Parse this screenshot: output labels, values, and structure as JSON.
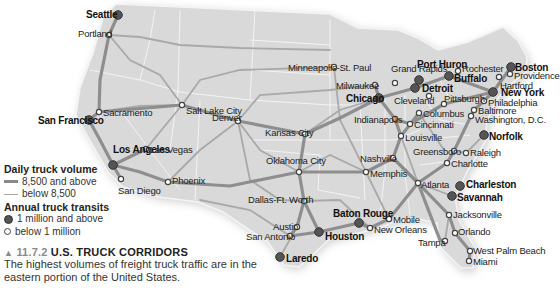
{
  "map": {
    "title": "U.S. Truck Corridors",
    "land_color": "#d8d8d8",
    "border_color": "#ffffff",
    "route_major_color": "#8a8a8a",
    "route_minor_color": "#a8a8a8",
    "cities": [
      {
        "name": "Seattle",
        "size": "major",
        "x": 118,
        "y": 15,
        "lx": 86,
        "ly": 10
      },
      {
        "name": "Portland",
        "size": "minor",
        "x": 109,
        "y": 35,
        "lx": 78,
        "ly": 29
      },
      {
        "name": "San Francisco",
        "size": "major",
        "x": 89,
        "y": 120,
        "lx": 38,
        "ly": 116
      },
      {
        "name": "Sacramento",
        "size": "minor",
        "x": 99,
        "y": 112,
        "lx": 103,
        "ly": 108
      },
      {
        "name": "Los Angeles",
        "size": "major",
        "x": 113,
        "y": 165,
        "lx": 113,
        "ly": 145
      },
      {
        "name": "Las Vegas",
        "size": "minor",
        "x": 146,
        "y": 149,
        "lx": 150,
        "ly": 145
      },
      {
        "name": "San Diego",
        "size": "minor",
        "x": 121,
        "y": 179,
        "lx": 118,
        "ly": 186
      },
      {
        "name": "Phoenix",
        "size": "minor",
        "x": 168,
        "y": 182,
        "lx": 172,
        "ly": 176
      },
      {
        "name": "Salt Lake City",
        "size": "minor",
        "x": 182,
        "y": 105,
        "lx": 186,
        "ly": 106
      },
      {
        "name": "Denver",
        "size": "minor",
        "x": 238,
        "y": 121,
        "lx": 212,
        "ly": 113
      },
      {
        "name": "Minneapolis-St. Paul",
        "size": "minor",
        "x": 334,
        "y": 67,
        "lx": 288,
        "ly": 63
      },
      {
        "name": "Milwaukee",
        "size": "minor",
        "x": 375,
        "y": 85,
        "lx": 336,
        "ly": 81
      },
      {
        "name": "Chicago",
        "size": "major",
        "x": 379,
        "y": 98,
        "lx": 346,
        "ly": 94
      },
      {
        "name": "Grand Rapids",
        "size": "minor",
        "x": 395,
        "y": 83,
        "lx": 391,
        "ly": 64
      },
      {
        "name": "Port Huron",
        "size": "major",
        "x": 419,
        "y": 80,
        "lx": 417,
        "ly": 60
      },
      {
        "name": "Detroit",
        "size": "major",
        "x": 415,
        "y": 88,
        "lx": 422,
        "ly": 84
      },
      {
        "name": "Cleveland",
        "size": "minor",
        "x": 429,
        "y": 96,
        "lx": 394,
        "ly": 96
      },
      {
        "name": "Buffalo",
        "size": "major",
        "x": 449,
        "y": 76,
        "lx": 454,
        "ly": 74
      },
      {
        "name": "Rochester",
        "size": "minor",
        "x": 458,
        "y": 71,
        "lx": 462,
        "ly": 64
      },
      {
        "name": "Pittsburgh",
        "size": "minor",
        "x": 444,
        "y": 104,
        "lx": 444,
        "ly": 94
      },
      {
        "name": "Columbus",
        "size": "minor",
        "x": 419,
        "y": 113,
        "lx": 423,
        "ly": 109
      },
      {
        "name": "Cincinnati",
        "size": "minor",
        "x": 410,
        "y": 124,
        "lx": 414,
        "ly": 120
      },
      {
        "name": "Indianapolis",
        "size": "minor",
        "x": 395,
        "y": 119,
        "lx": 354,
        "ly": 115
      },
      {
        "name": "Louisville",
        "size": "minor",
        "x": 401,
        "y": 136,
        "lx": 405,
        "ly": 133
      },
      {
        "name": "Boston",
        "size": "major",
        "x": 511,
        "y": 67,
        "lx": 515,
        "ly": 63
      },
      {
        "name": "Providence",
        "size": "minor",
        "x": 510,
        "y": 74,
        "lx": 514,
        "ly": 71
      },
      {
        "name": "Hartford",
        "size": "minor",
        "x": 499,
        "y": 77,
        "lx": 500,
        "ly": 81
      },
      {
        "name": "New York",
        "size": "major",
        "x": 493,
        "y": 92,
        "lx": 501,
        "ly": 88
      },
      {
        "name": "Philadelphia",
        "size": "minor",
        "x": 484,
        "y": 101,
        "lx": 488,
        "ly": 98
      },
      {
        "name": "Baltimore",
        "size": "minor",
        "x": 474,
        "y": 110,
        "lx": 478,
        "ly": 106
      },
      {
        "name": "Washington, D.C.",
        "size": "minor",
        "x": 471,
        "y": 116,
        "lx": 475,
        "ly": 115
      },
      {
        "name": "Norfolk",
        "size": "major",
        "x": 484,
        "y": 135,
        "lx": 489,
        "ly": 132
      },
      {
        "name": "Greensboro",
        "size": "minor",
        "x": 454,
        "y": 151,
        "lx": 413,
        "ly": 147
      },
      {
        "name": "Raleigh",
        "size": "minor",
        "x": 466,
        "y": 153,
        "lx": 470,
        "ly": 148
      },
      {
        "name": "Charlotte",
        "size": "minor",
        "x": 447,
        "y": 163,
        "lx": 451,
        "ly": 159
      },
      {
        "name": "Nashville",
        "size": "minor",
        "x": 393,
        "y": 158,
        "lx": 360,
        "ly": 154
      },
      {
        "name": "Memphis",
        "size": "minor",
        "x": 366,
        "y": 172,
        "lx": 370,
        "ly": 169
      },
      {
        "name": "Atlanta",
        "size": "minor",
        "x": 418,
        "y": 183,
        "lx": 421,
        "ly": 180
      },
      {
        "name": "Charleston",
        "size": "major",
        "x": 460,
        "y": 186,
        "lx": 466,
        "ly": 180
      },
      {
        "name": "Savannah",
        "size": "major",
        "x": 452,
        "y": 196,
        "lx": 457,
        "ly": 193
      },
      {
        "name": "Jacksonville",
        "size": "minor",
        "x": 449,
        "y": 215,
        "lx": 453,
        "ly": 210
      },
      {
        "name": "Orlando",
        "size": "minor",
        "x": 455,
        "y": 233,
        "lx": 458,
        "ly": 227
      },
      {
        "name": "Tampa",
        "size": "minor",
        "x": 445,
        "y": 241,
        "lx": 418,
        "ly": 238
      },
      {
        "name": "West Palm Beach",
        "size": "minor",
        "x": 470,
        "y": 251,
        "lx": 473,
        "ly": 246
      },
      {
        "name": "Miami",
        "size": "minor",
        "x": 469,
        "y": 261,
        "lx": 473,
        "ly": 257
      },
      {
        "name": "Mobile",
        "size": "minor",
        "x": 389,
        "y": 219,
        "lx": 393,
        "ly": 215
      },
      {
        "name": "New Orleans",
        "size": "minor",
        "x": 370,
        "y": 228,
        "lx": 374,
        "ly": 225
      },
      {
        "name": "Baton Rouge",
        "size": "major",
        "x": 359,
        "y": 223,
        "lx": 333,
        "ly": 209
      },
      {
        "name": "Houston",
        "size": "major",
        "x": 319,
        "y": 232,
        "lx": 325,
        "ly": 232
      },
      {
        "name": "Austin",
        "size": "minor",
        "x": 297,
        "y": 227,
        "lx": 273,
        "ly": 222
      },
      {
        "name": "San Antonio",
        "size": "minor",
        "x": 290,
        "y": 236,
        "lx": 246,
        "ly": 232
      },
      {
        "name": "Laredo",
        "size": "major",
        "x": 280,
        "y": 257,
        "lx": 286,
        "ly": 254
      },
      {
        "name": "Dallas-Ft. Worth",
        "size": "minor",
        "x": 304,
        "y": 201,
        "lx": 248,
        "ly": 195
      },
      {
        "name": "Oklahoma City",
        "size": "minor",
        "x": 299,
        "y": 172,
        "lx": 266,
        "ly": 156
      },
      {
        "name": "Kansas City",
        "size": "minor",
        "x": 305,
        "y": 134,
        "lx": 265,
        "ly": 128
      }
    ]
  },
  "legend": {
    "volume_title": "Daily truck volume",
    "volume_high": "8,500 and above",
    "volume_low": "below 8,500",
    "transits_title": "Annual truck transits",
    "transits_high": "1 million and above",
    "transits_low": "below 1 million"
  },
  "caption": {
    "marker": "▲",
    "number": "11.7.2",
    "title": "U.S. TRUCK CORRIDORS",
    "text": "The highest volumes of freight truck traffic are in the eastern portion of the United States."
  }
}
